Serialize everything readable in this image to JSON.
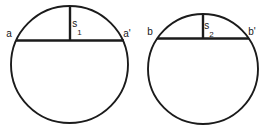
{
  "figure": {
    "background_color": "#ffffff",
    "stroke_color": "#1b1b1b",
    "text_color": "#161616",
    "width": 270,
    "height": 133,
    "shapes": [
      {
        "id": "left",
        "name": "circle-left",
        "center_x": 69.5,
        "center_y": 64.5,
        "radius": 58.5,
        "stroke_width": 1.9,
        "chord": {
          "y": 40.5,
          "x1": 16.0,
          "x2": 124.0,
          "stroke_width": 2.4,
          "left_label": "a",
          "right_label": "a'",
          "left_label_x": 9,
          "left_label_y": 37,
          "right_label_x": 127,
          "right_label_y": 37
        },
        "sagitta": {
          "x": 70.0,
          "y_top": 6.0,
          "y_bottom": 40.5,
          "stroke_width": 2.4,
          "label": "s",
          "subscript": "1",
          "label_x": 77,
          "label_y": 27
        }
      },
      {
        "id": "right",
        "name": "circle-right",
        "center_x": 203.0,
        "center_y": 69.0,
        "radius": 55.0,
        "stroke_width": 1.9,
        "chord": {
          "y": 38.5,
          "x1": 157.0,
          "x2": 249.0,
          "stroke_width": 2.4,
          "left_label": "b",
          "right_label": "b'",
          "left_label_x": 150,
          "left_label_y": 35,
          "right_label_x": 252,
          "right_label_y": 35
        },
        "sagitta": {
          "x": 203.0,
          "y_top": 14.5,
          "y_bottom": 38.5,
          "stroke_width": 2.4,
          "label": "s",
          "subscript": "2",
          "label_x": 209,
          "label_y": 29
        }
      }
    ]
  }
}
